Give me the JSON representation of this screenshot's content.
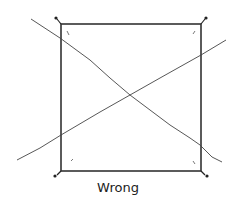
{
  "figure": {
    "caption": "Wrong",
    "stroke_color": "#333333",
    "square": {
      "x": 61,
      "y": 24,
      "width": 140,
      "height": 147
    },
    "diagonal_lines": [
      {
        "name": "line-top-left-to-bottom-right",
        "points": "31,19 90,60 130,95 170,125 200,145 222,162"
      },
      {
        "name": "line-bottom-left-to-top-right",
        "points": "17,160 60,135 100,110 140,90 180,67 226,40"
      }
    ]
  }
}
